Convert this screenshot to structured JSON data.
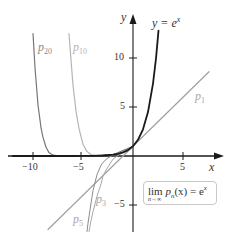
{
  "chart_data": {
    "type": "line",
    "title": "",
    "xlabel": "x",
    "ylabel": "y",
    "xlim": [
      -12.5,
      9.5
    ],
    "ylim": [
      -7.7,
      14.3
    ],
    "grid": false,
    "xticks": [
      -10,
      -5,
      5
    ],
    "xtick_labels": [
      "−10",
      "−5",
      "5"
    ],
    "yticks": [
      10,
      5,
      -5
    ],
    "ytick_labels": [
      "10",
      "5",
      "−5"
    ],
    "series": [
      {
        "name": "y = e^x",
        "label": "y = e",
        "label_sup": "x",
        "color": "#1a1a1a",
        "width": 1.8,
        "x": [
          -12,
          -10,
          -8,
          -6,
          -5,
          -4,
          -3,
          -2,
          -1.5,
          -1,
          -0.5,
          0,
          0.5,
          1,
          1.5,
          2,
          2.3,
          2.55
        ],
        "y": [
          0,
          5e-05,
          0.0003,
          0.0025,
          0.0067,
          0.018,
          0.05,
          0.135,
          0.223,
          0.368,
          0.607,
          1,
          1.65,
          2.72,
          4.48,
          7.39,
          9.97,
          12.8
        ]
      },
      {
        "name": "p20",
        "label": "p",
        "label_sub": "20",
        "color": "#777777",
        "width": 1.2,
        "x": [
          -10,
          -9.8,
          -9.5,
          -9.2,
          -9,
          -8.7,
          -8.4,
          -8,
          -7.5,
          -7,
          -6,
          -4,
          -2,
          0
        ],
        "y": [
          12.5,
          9.0,
          5.2,
          2.9,
          1.9,
          0.9,
          0.35,
          0.08,
          0.01,
          0.001,
          0.0025,
          0.018,
          0.135,
          1
        ]
      },
      {
        "name": "p10",
        "label": "p",
        "label_sub": "10",
        "color": "#b5b5b5",
        "width": 1.2,
        "x": [
          -6.4,
          -6.2,
          -6,
          -5.7,
          -5.4,
          -5,
          -4.6,
          -4.2,
          -3.8,
          -3,
          -2,
          -1,
          0
        ],
        "y": [
          12.5,
          9.8,
          7.2,
          4.6,
          2.8,
          1.2,
          0.45,
          0.15,
          0.06,
          0.05,
          0.135,
          0.368,
          1
        ]
      },
      {
        "name": "p5",
        "label": "p",
        "label_sub": "5",
        "color": "#8c8c8c",
        "width": 1.0,
        "x": [
          -4.6,
          -4.5,
          -4.3,
          -4,
          -3.6,
          -3.2,
          -3,
          -2.5,
          -2,
          -1.5,
          -1,
          -0.5,
          0,
          0.5
        ],
        "y": [
          -7.7,
          -6.86,
          -5.5,
          -3.53,
          -1.9,
          -0.95,
          -0.65,
          -0.18,
          0.067,
          0.21,
          0.367,
          0.607,
          1,
          1.65
        ]
      },
      {
        "name": "p3",
        "label": "p",
        "label_sub": "3",
        "color": "#a8a8a8",
        "width": 1.0,
        "x": [
          -4.4,
          -4.2,
          -4,
          -3.6,
          -3.2,
          -3,
          -2.5,
          -2,
          -1.5,
          -1,
          -0.5,
          0,
          0.5,
          1
        ],
        "y": [
          -7.7,
          -6.6,
          -5.67,
          -4.1,
          -2.86,
          -2.0,
          -1.1,
          -0.33,
          0.06,
          0.333,
          0.6,
          1,
          1.65,
          2.67
        ]
      },
      {
        "name": "p1",
        "label": "p",
        "label_sub": "1",
        "color": "#a0a0a0",
        "width": 1.2,
        "x": [
          -8.5,
          7.6
        ],
        "y": [
          -7.5,
          8.6
        ]
      }
    ],
    "annotation": {
      "text_main": "lim",
      "text_rest": "p",
      "text_sub_n": "n",
      "text_tail": "(x) = e",
      "text_sup": "x",
      "text_under": "n→∞"
    }
  },
  "labels": {
    "y_axis": "y",
    "x_axis": "x",
    "ex_main": "y = e",
    "ex_sup": "x",
    "p20_main": "p",
    "p20_sub": "20",
    "p10_main": "p",
    "p10_sub": "10",
    "p1_main": "p",
    "p1_sub": "1",
    "p3_main": "p",
    "p3_sub": "3",
    "p5_main": "p",
    "p5_sub": "5",
    "tick_x_m10": "−10",
    "tick_x_m5": "−5",
    "tick_x_5": "5",
    "tick_y_10": "10",
    "tick_y_5": "5",
    "tick_y_m5": "−5",
    "lim_word": "lim",
    "lim_under": "n→∞",
    "lim_p": "p",
    "lim_n": "n",
    "lim_tail": "(x) = e",
    "lim_sup": "x"
  }
}
